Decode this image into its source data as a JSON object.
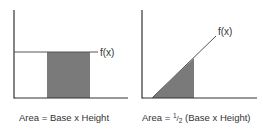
{
  "colors": {
    "axis": "#333333",
    "line": "#555555",
    "shade": "#7a7a7a",
    "text": "#333333"
  },
  "left_diagram": {
    "function_label": "f(x)",
    "caption": "Area = Base x Height",
    "shape": "rectangle"
  },
  "right_diagram": {
    "function_label": "f(x)",
    "caption_prefix": "Area = ",
    "caption_fraction_num": "1",
    "caption_fraction_den": "2",
    "caption_suffix": " (Base x Height)",
    "shape": "triangle"
  }
}
